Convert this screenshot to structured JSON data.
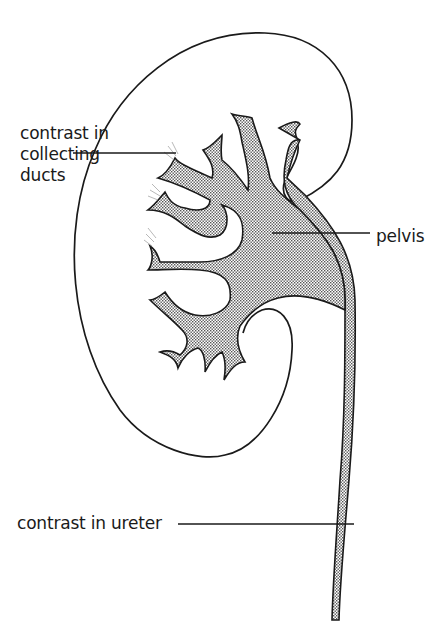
{
  "diagram": {
    "colors": {
      "line": "#1a1a1a",
      "contrast_fill": "#c9c9c9",
      "background": "#ffffff"
    },
    "labels": {
      "collecting_ducts": {
        "line1": "contrast in",
        "line2": "collecting",
        "line3": "ducts"
      },
      "pelvis": "pelvis",
      "ureter": "contrast in ureter"
    }
  }
}
